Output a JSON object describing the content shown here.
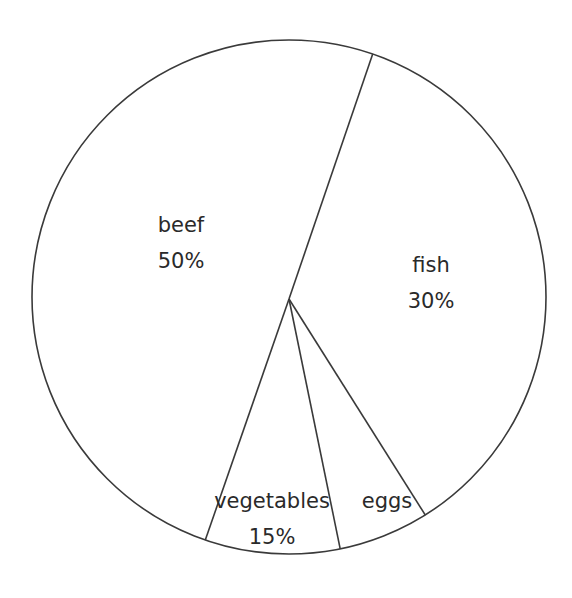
{
  "chart_data": {
    "type": "pie",
    "title": "",
    "slices": [
      {
        "label": "fish",
        "value_label": "30%",
        "value": 30
      },
      {
        "label": "eggs",
        "value_label": "",
        "value": 5
      },
      {
        "label": "vegetables",
        "value_label": "15%",
        "value": 15
      },
      {
        "label": "beef",
        "value_label": "50%",
        "value": 50
      }
    ],
    "start_angle_deg": 19,
    "direction": "clockwise",
    "legend": "none",
    "colors": {
      "fill": "#ffffff",
      "stroke": "#3a3a3a",
      "text": "#2a2a2a"
    }
  }
}
